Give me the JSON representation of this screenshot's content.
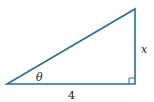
{
  "diagram": {
    "type": "right-triangle",
    "line_color": "#2b6e8f",
    "vertices": {
      "bottom_left": [
        7,
        84
      ],
      "bottom_right": [
        135,
        84
      ],
      "top_right": [
        135,
        9
      ]
    },
    "labels": {
      "angle": "θ",
      "opposite_side": "x",
      "adjacent_side": "4"
    },
    "right_angle_marker": true
  }
}
